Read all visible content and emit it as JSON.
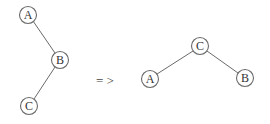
{
  "diagram": {
    "type": "tree-rotation",
    "before": {
      "nodes": [
        {
          "id": "A",
          "label": "A"
        },
        {
          "id": "B",
          "label": "B"
        },
        {
          "id": "C",
          "label": "C"
        }
      ],
      "edges": [
        [
          "A",
          "B"
        ],
        [
          "B",
          "C"
        ]
      ]
    },
    "transform_symbol": "= >",
    "after": {
      "nodes": [
        {
          "id": "C",
          "label": "C"
        },
        {
          "id": "A",
          "label": "A"
        },
        {
          "id": "B",
          "label": "B"
        }
      ],
      "edges": [
        [
          "C",
          "A"
        ],
        [
          "C",
          "B"
        ]
      ]
    },
    "colors": {
      "stroke": "#6a6a6a",
      "text": "#333333",
      "background": "#ffffff"
    }
  }
}
